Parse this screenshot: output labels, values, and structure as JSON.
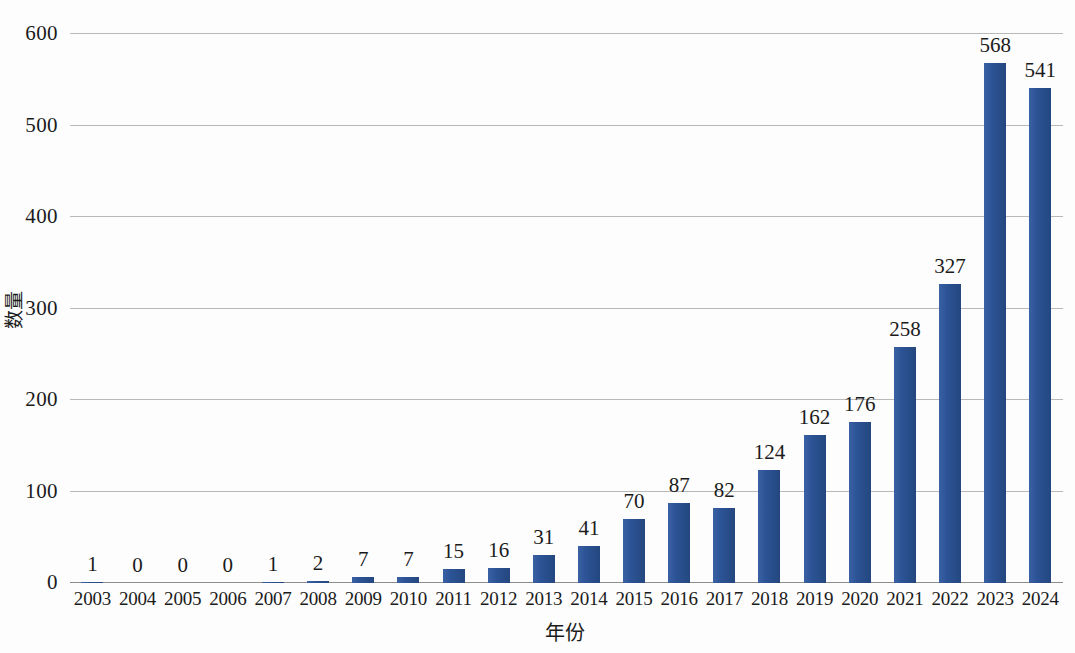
{
  "chart_data": {
    "type": "bar",
    "title": "",
    "xlabel": "年份",
    "ylabel": "数量",
    "categories": [
      "2003",
      "2004",
      "2005",
      "2006",
      "2007",
      "2008",
      "2009",
      "2010",
      "2011",
      "2012",
      "2013",
      "2014",
      "2015",
      "2016",
      "2017",
      "2018",
      "2019",
      "2020",
      "2021",
      "2022",
      "2023",
      "2024"
    ],
    "values": [
      1,
      0,
      0,
      0,
      1,
      2,
      7,
      7,
      15,
      16,
      31,
      41,
      70,
      87,
      82,
      124,
      162,
      176,
      258,
      327,
      568,
      541
    ],
    "value_labels": [
      "1",
      "0",
      "0",
      "0",
      "1",
      "2",
      "7",
      "7",
      "15",
      "16",
      "31",
      "41",
      "70",
      "87",
      "82",
      "124",
      "162",
      "176",
      "258",
      "327",
      "568",
      "541"
    ],
    "ylim": [
      0,
      600
    ],
    "y_ticks": [
      0,
      100,
      200,
      300,
      400,
      500,
      600
    ],
    "y_tick_labels": [
      "0",
      "100",
      "200",
      "300",
      "400",
      "500",
      "600"
    ],
    "grid": true,
    "legend": false,
    "series": [
      {
        "name": "数量",
        "values": [
          1,
          0,
          0,
          0,
          1,
          2,
          7,
          7,
          15,
          16,
          31,
          41,
          70,
          87,
          82,
          124,
          162,
          176,
          258,
          327,
          568,
          541
        ]
      }
    ],
    "colors": {
      "bar": "#2c5395",
      "grid": "#b9b9b9",
      "axis": "#8d8d8d",
      "text": "#1b1b1b",
      "background": "#fdfdfd"
    }
  }
}
